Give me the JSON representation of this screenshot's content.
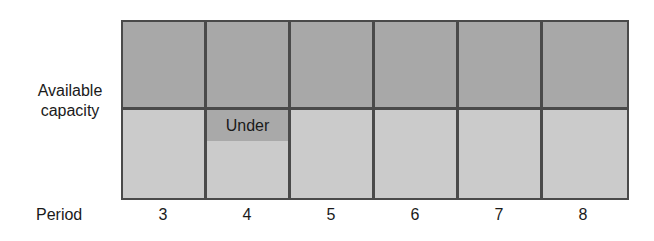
{
  "row_label": {
    "line1": "Available",
    "line2": "capacity"
  },
  "axis": {
    "title": "Period",
    "periods": [
      "3",
      "4",
      "5",
      "6",
      "7",
      "8"
    ]
  },
  "annotation": {
    "label": "Under",
    "period": "4"
  },
  "colors": {
    "top_row": "#a8a8a8",
    "bottom_row": "#cbcbcb",
    "under_box": "#a9a9a9",
    "grid_line": "#4a4a4a"
  }
}
